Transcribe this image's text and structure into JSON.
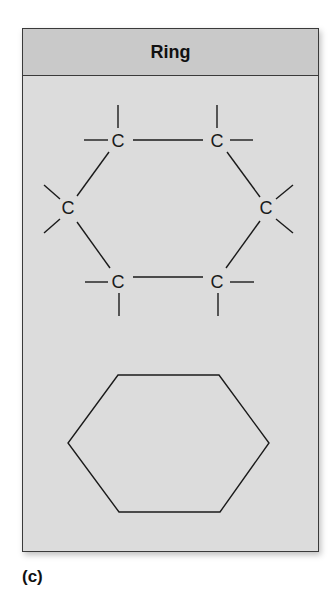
{
  "panel": {
    "title": "Ring"
  },
  "structural_formula": {
    "atoms": [
      {
        "label": "C",
        "x": 118,
        "y": 141
      },
      {
        "label": "C",
        "x": 217,
        "y": 141
      },
      {
        "label": "C",
        "x": 68,
        "y": 208
      },
      {
        "label": "C",
        "x": 266,
        "y": 208
      },
      {
        "label": "C",
        "x": 118,
        "y": 280
      },
      {
        "label": "C",
        "x": 217,
        "y": 280
      }
    ]
  },
  "skeletal_formula": {
    "shape": "hexagon"
  },
  "caption": "(c)",
  "colors": {
    "panel_bg": "#dcdcdc",
    "header_bg": "#c9c9c9",
    "line": "#1a1a1a"
  }
}
